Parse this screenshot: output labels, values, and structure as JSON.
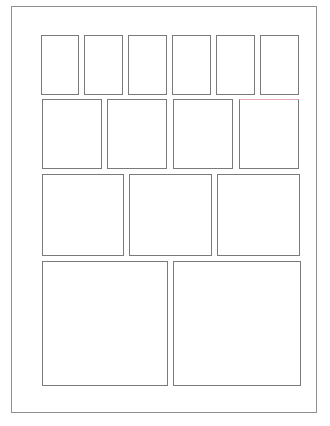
{
  "page": {
    "type": "page-layout-thumbnail",
    "frame_border_color": "#8f8f8f",
    "cell_border_color": "#7a7a7a",
    "background_color": "#ffffff"
  },
  "layout": {
    "rows": [
      {
        "name": "row-1",
        "cell_count": 6
      },
      {
        "name": "row-2",
        "cell_count": 4
      },
      {
        "name": "row-3",
        "cell_count": 3
      },
      {
        "name": "row-4",
        "cell_count": 2
      }
    ],
    "total_cells": 15
  }
}
